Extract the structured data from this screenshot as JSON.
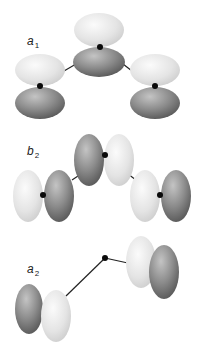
{
  "diagram": {
    "type": "molecular-orbital-symmetry",
    "panels": [
      {
        "id": "a1",
        "label": {
          "main": "a",
          "sub": "1"
        },
        "description": "Three atoms, p-orbitals oriented vertically; center atom lobes light on top / dark on bottom; outer atoms light on top / dark on bottom"
      },
      {
        "id": "b2",
        "label": {
          "main": "b",
          "sub": "2"
        },
        "description": "Three atoms, p-orbitals oriented horizontally; center atom dark left / light right; left atom light left / dark right; right atom light left / dark right"
      },
      {
        "id": "a2",
        "label": {
          "main": "a",
          "sub": "2"
        },
        "description": "Two outer atoms with p-orbitals perpendicular (out of plane); center atom has no orbital contribution; left pair dark back / light front, right pair light back / dark front"
      }
    ],
    "colors": {
      "light_lobe": "#e6e6e6",
      "dark_lobe": "#7a7a7a",
      "atom": "#0a0a0a",
      "bond": "#222222",
      "background": "#ffffff"
    }
  }
}
